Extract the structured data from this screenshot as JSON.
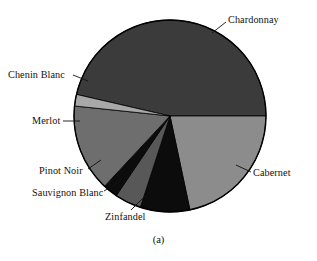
{
  "figure": {
    "caption": "(a)",
    "background_color": "#ffffff",
    "text_color": "#111111"
  },
  "chart_data": {
    "type": "pie",
    "title": "",
    "subtitle": "",
    "xlabel": "",
    "ylabel": "",
    "legend_position": "none",
    "labels_position": "outside-with-leader-lines",
    "grid": false,
    "start_angle_deg": 0,
    "direction": "clockwise",
    "categories": [
      "Chardonnay",
      "Cabernet",
      "Zinfandel",
      "Sauvignon Blanc",
      "Pinot Noir",
      "Merlot",
      "Chenin Blanc"
    ],
    "values": [
      46.4,
      21.7,
      8.3,
      4.4,
      2.5,
      14.7,
      2.0
    ],
    "units": "percent",
    "slices": [
      {
        "label": "Chardonnay",
        "value": 46.4,
        "start_deg": 193,
        "end_deg": 360,
        "color": "#3b3b3b"
      },
      {
        "label": "Cabernet",
        "value": 21.7,
        "start_deg": 0,
        "end_deg": 78,
        "color": "#8c8c8c"
      },
      {
        "label": "Zinfandel",
        "value": 8.3,
        "start_deg": 78,
        "end_deg": 108,
        "color": "#0c0c0c"
      },
      {
        "label": "Sauvignon Blanc",
        "value": 4.4,
        "start_deg": 108,
        "end_deg": 124,
        "color": "#585858"
      },
      {
        "label": "Pinot Noir",
        "value": 2.5,
        "start_deg": 124,
        "end_deg": 133,
        "color": "#0c0c0c"
      },
      {
        "label": "Merlot",
        "value": 14.7,
        "start_deg": 133,
        "end_deg": 186,
        "color": "#6e6e6e"
      },
      {
        "label": "Chenin Blanc",
        "value": 2.0,
        "start_deg": 186,
        "end_deg": 193,
        "color": "#a8a8a8"
      }
    ],
    "geometry": {
      "center_x": 170,
      "center_y": 116,
      "radius": 96,
      "outline_color": "#000000"
    }
  },
  "labels": {
    "chardonnay": "Chardonnay",
    "cabernet": "Cabernet",
    "zinfandel": "Zinfandel",
    "sauvignon_blanc": "Sauvignon Blanc",
    "pinot_noir": "Pinot Noir",
    "merlot": "Merlot",
    "chenin_blanc": "Chenin Blanc"
  }
}
